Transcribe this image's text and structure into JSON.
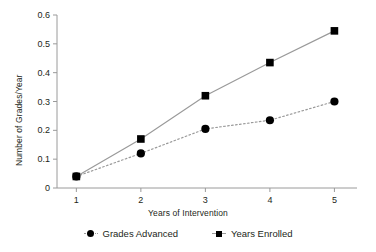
{
  "chart_data": {
    "type": "line",
    "title": "",
    "xlabel": "Years of Intervention",
    "ylabel": "Number of Grades/Year",
    "x": [
      1,
      2,
      3,
      4,
      5
    ],
    "xtick_labels": [
      "1",
      "2",
      "3",
      "4",
      "5"
    ],
    "ytick_labels": [
      "0",
      "0.1",
      "0.2",
      "0.3",
      "0.4",
      "0.5",
      "0.6"
    ],
    "ytick_values": [
      0,
      0.1,
      0.2,
      0.3,
      0.4,
      0.5,
      0.6
    ],
    "xlim": [
      0.7,
      5.35
    ],
    "ylim": [
      0,
      0.6
    ],
    "grid": false,
    "legend_position": "bottom-center",
    "series": [
      {
        "name": "Grades Advanced",
        "values": [
          0.04,
          0.12,
          0.205,
          0.235,
          0.3
        ],
        "marker": "circle",
        "marker_color": "#000000",
        "line_style": "dotted",
        "line_color": "#9a9a9a"
      },
      {
        "name": "Years Enrolled",
        "values": [
          0.04,
          0.17,
          0.32,
          0.435,
          0.545
        ],
        "marker": "square",
        "marker_color": "#000000",
        "line_style": "solid",
        "line_color": "#9a9a9a"
      }
    ],
    "axis_color": "#9a9a9a",
    "text_color": "#231f20",
    "background": "#ffffff"
  }
}
